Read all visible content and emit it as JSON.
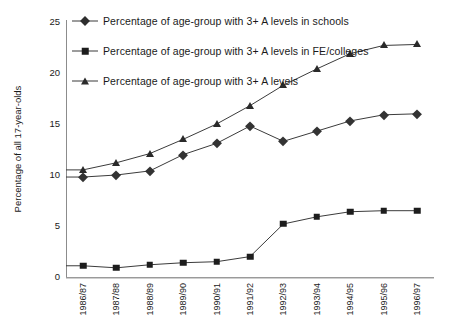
{
  "chart_data": {
    "type": "line",
    "title": "",
    "xlabel": "",
    "ylabel": "Percentage of all 17-year-olds",
    "ylim": [
      0,
      25
    ],
    "yticks": [
      0,
      5,
      10,
      15,
      20,
      25
    ],
    "grid": false,
    "legend_position": "top-left-inside",
    "categories": [
      "1986/87",
      "1987/88",
      "1988/89",
      "1989/90",
      "1990/91",
      "1991/92",
      "1992/93",
      "1993/94",
      "1994/95",
      "1995/96",
      "1996/97"
    ],
    "series": [
      {
        "name": "Percentage of age-group with 3+ A  levels in schools",
        "marker": "diamond",
        "color": "#333333",
        "values": [
          9.8,
          10.0,
          10.4,
          12.0,
          13.1,
          14.8,
          13.3,
          14.3,
          15.3,
          15.9,
          16.0
        ]
      },
      {
        "name": "Percentage of age-group with 3+ A  levels in FE/colleges",
        "marker": "square",
        "color": "#1d1d1d",
        "values": [
          1.1,
          0.9,
          1.2,
          1.4,
          1.5,
          2.0,
          5.2,
          5.9,
          6.4,
          6.5,
          6.5
        ]
      },
      {
        "name": "Percentage of age-group with 3+ A  levels",
        "marker": "triangle",
        "color": "#2a2a2a",
        "values": [
          10.5,
          11.2,
          12.1,
          13.5,
          15.0,
          16.8,
          18.8,
          20.4,
          21.9,
          22.7,
          22.8
        ]
      }
    ]
  },
  "legend": {
    "items": [
      {
        "label": "Percentage of age-group with 3+ A  levels in schools",
        "marker": "diamond-marker-icon"
      },
      {
        "label": "Percentage of age-group with 3+ A  levels in FE/colleges",
        "marker": "square-marker-icon"
      },
      {
        "label": "Percentage of age-group with 3+ A  levels",
        "marker": "triangle-marker-icon"
      }
    ]
  },
  "axes": {
    "y_title": "Percentage of all 17-year-olds",
    "y_tick_labels": [
      "25",
      "20",
      "15",
      "10",
      "5",
      "0"
    ],
    "x_tick_labels": [
      "1986/87",
      "1987/88",
      "1988/89",
      "1989/90",
      "1990/91",
      "1991/92",
      "1992/93",
      "1993/94",
      "1994/95",
      "1995/96",
      "1996/97"
    ]
  },
  "style": {
    "line_color": "#3b3b3b",
    "axis_color": "#8c8c8c",
    "background": "#ffffff",
    "text_color": "#1a1a1a"
  }
}
